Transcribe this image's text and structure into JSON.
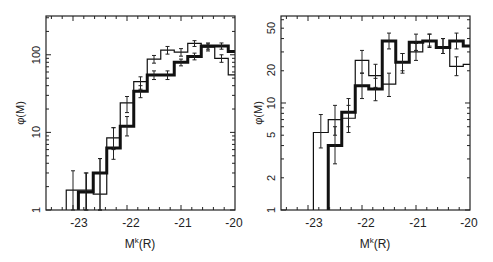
{
  "chart_data": [
    {
      "type": "line",
      "subtype": "step-histogram",
      "title": "",
      "xlabel": "M^k(R)",
      "ylabel": "φ(M)",
      "yscale": "log",
      "xlim": [
        -23.5,
        -20
      ],
      "ylim": [
        1,
        316
      ],
      "x_ticks": [
        "-23",
        "-22",
        "-21",
        "-20"
      ],
      "y_ticks": [
        "1",
        "10",
        "100"
      ],
      "grid": false,
      "legend": null,
      "series": [
        {
          "name": "thin",
          "line_width": 1.2,
          "bin_edges": [
            -23.125,
            -22.875,
            -22.625,
            -22.375,
            -22.125,
            -21.875,
            -21.625,
            -21.375,
            -21.125,
            -20.875,
            -20.625,
            -20.375,
            -20.125,
            -20.0
          ],
          "values": [
            1.8,
            1.8,
            1.6,
            8.5,
            24,
            45,
            88,
            115,
            108,
            140,
            125,
            90,
            55
          ],
          "err_low": [
            1.0,
            1.0,
            1.0,
            6.0,
            18,
            36,
            78,
            102,
            96,
            128,
            112,
            80,
            55
          ],
          "err_high": [
            3.2,
            3.0,
            4.6,
            11.5,
            29,
            52,
            98,
            128,
            120,
            152,
            138,
            100,
            55
          ]
        },
        {
          "name": "thick",
          "line_width": 3,
          "bin_edges": [
            -22.9,
            -22.625,
            -22.375,
            -22.125,
            -21.875,
            -21.625,
            -21.375,
            -21.125,
            -20.875,
            -20.625,
            -20.375,
            -20.125,
            -20.0
          ],
          "values": [
            1.7,
            3.0,
            6.3,
            12,
            34,
            55,
            55,
            80,
            95,
            130,
            130,
            110
          ],
          "err_low": [
            1.0,
            1.0,
            4.5,
            9.0,
            28,
            48,
            48,
            72,
            86,
            118,
            118,
            110
          ],
          "err_high": [
            3.0,
            4.6,
            11.5,
            16,
            40,
            62,
            62,
            88,
            105,
            142,
            142,
            110
          ]
        }
      ]
    },
    {
      "type": "line",
      "subtype": "step-histogram",
      "title": "",
      "xlabel": "M^k(R)",
      "ylabel": "φ(M)",
      "yscale": "log",
      "xlim": [
        -23.5,
        -20
      ],
      "ylim": [
        1,
        65
      ],
      "x_ticks": [
        "-23",
        "-22",
        "-21",
        "-20"
      ],
      "y_ticks": [
        "1",
        "2",
        "5",
        "10",
        "20",
        "50"
      ],
      "grid": false,
      "legend": null,
      "series": [
        {
          "name": "thin",
          "line_width": 1.2,
          "bin_edges": [
            -22.9,
            -22.625,
            -22.375,
            -22.125,
            -21.875,
            -21.625,
            -21.375,
            -21.125,
            -20.875,
            -20.625,
            -20.375,
            -20.125,
            -20.0
          ],
          "values": [
            5.3,
            7.0,
            7.2,
            25,
            18,
            15,
            24,
            30,
            38,
            33,
            22,
            23
          ],
          "err_low": [
            3.8,
            5.0,
            5.3,
            19,
            14,
            11.5,
            19,
            25,
            34,
            29,
            18,
            23
          ],
          "err_high": [
            7.8,
            9.5,
            9.5,
            31,
            23,
            19,
            29,
            36,
            44,
            40,
            27,
            23
          ]
        },
        {
          "name": "thick",
          "line_width": 3,
          "bin_edges": [
            -22.625,
            -22.375,
            -22.125,
            -21.875,
            -21.625,
            -21.375,
            -21.125,
            -20.875,
            -20.625,
            -20.375,
            -20.125,
            -20.0
          ],
          "values": [
            4.0,
            8.2,
            14.5,
            13.5,
            38,
            24,
            37,
            38,
            33,
            38,
            34
          ],
          "err_low": [
            2.7,
            6.0,
            11.0,
            10.5,
            32,
            20,
            31,
            33,
            29,
            32,
            34
          ],
          "err_high": [
            6.0,
            11,
            19,
            17,
            45,
            29,
            44,
            44,
            40,
            45,
            34
          ]
        }
      ]
    }
  ],
  "panels": [
    {
      "x_label_main": "M",
      "x_label_sup": "k",
      "x_label_paren": "(R)",
      "y_label": "φ(M)",
      "x_ticks": [
        "-23",
        "-22",
        "-21",
        "-20"
      ],
      "y_ticks": [
        "1",
        "10",
        "100"
      ]
    },
    {
      "x_label_main": "M",
      "x_label_sup": "k",
      "x_label_paren": "(R)",
      "y_label": "φ(M)",
      "x_ticks": [
        "-23",
        "-22",
        "-21",
        "-20"
      ],
      "y_ticks": [
        "1",
        "2",
        "5",
        "10",
        "20",
        "50"
      ]
    }
  ]
}
